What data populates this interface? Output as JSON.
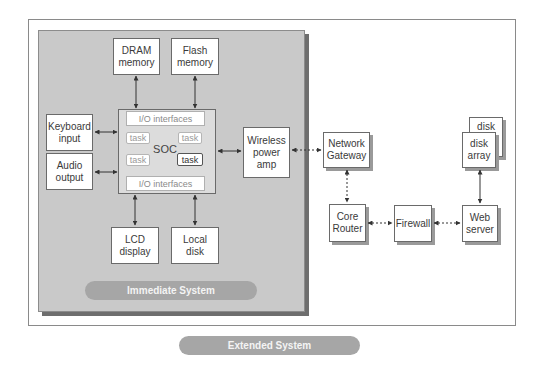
{
  "diagram": {
    "immediate_system": {
      "label": "Immediate System",
      "components": {
        "dram": "DRAM\nmemory",
        "flash": "Flash\nmemory",
        "keyboard": "Keyboard\ninput",
        "audio": "Audio\noutput",
        "lcd": "LCD\ndisplay",
        "local_disk": "Local\ndisk",
        "wireless": "Wireless\npower\namp"
      },
      "soc": {
        "label": "SOC",
        "io_top": "I/O interfaces",
        "io_bottom": "I/O interfaces",
        "tasks": [
          "task",
          "task",
          "task",
          "task"
        ]
      }
    },
    "extended_system": {
      "label": "Extended System",
      "components": {
        "gateway": "Network\nGateway",
        "router": "Core\nRouter",
        "firewall": "Firewall",
        "web_server": "Web\nserver",
        "disk_back": "disk",
        "disk_array": "disk\narray"
      }
    },
    "colors": {
      "panel": "#c9c9c9",
      "pill": "#a6a6a6",
      "border": "#6a6a6a"
    }
  }
}
